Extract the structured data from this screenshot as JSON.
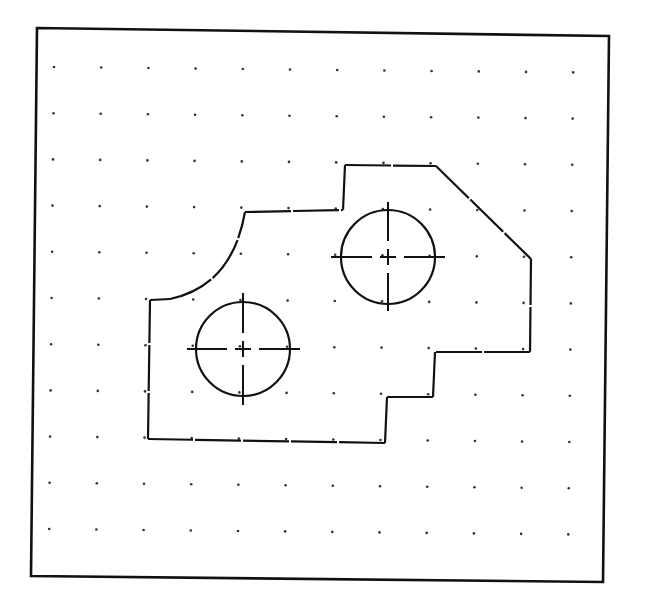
{
  "drawing": {
    "type": "cad-part-outline",
    "colors": {
      "background": "#ffffff",
      "ink": "#111111",
      "grid_dot": "#333333"
    },
    "frame": {
      "corners": [
        [
          37,
          28
        ],
        [
          609,
          36
        ],
        [
          603,
          582
        ],
        [
          31,
          576
        ]
      ]
    },
    "grid": {
      "origin": [
        54,
        67
      ],
      "spacing": [
        47.2,
        46.2
      ],
      "columns": 12,
      "rows": 11,
      "rotation_deg": 0.6
    },
    "outline": {
      "segments": [
        {
          "name": "left-edge",
          "d": "M148 439 L150 300"
        },
        {
          "name": "small-top-left",
          "d": "M150 300 L170 299"
        },
        {
          "name": "fillet-arc",
          "d": "M170 299 Q232 286 245 212"
        },
        {
          "name": "upper-left-top",
          "d": "M245 212 L343 210"
        },
        {
          "name": "step-up",
          "d": "M343 210 L345 165"
        },
        {
          "name": "top-edge",
          "d": "M345 165 L436 166"
        },
        {
          "name": "chamfer",
          "d": "M436 166 L531 259"
        },
        {
          "name": "right-edge",
          "d": "M531 259 L530 352"
        },
        {
          "name": "right-bottom",
          "d": "M530 352 L435 352"
        },
        {
          "name": "step-down-1",
          "d": "M435 352 L433 397"
        },
        {
          "name": "step-horizontal",
          "d": "M433 397 L387 397"
        },
        {
          "name": "step-down-2",
          "d": "M387 397 L385 443"
        },
        {
          "name": "bottom-edge",
          "d": "M385 443 L148 439"
        }
      ]
    },
    "holes": [
      {
        "name": "hole-left",
        "cx": 243,
        "cy": 349,
        "r": 47,
        "centerline_h": [
          187,
          300
        ],
        "centerline_v": [
          293,
          405
        ]
      },
      {
        "name": "hole-right",
        "cx": 388,
        "cy": 257,
        "r": 47,
        "centerline_h": [
          331,
          445
        ],
        "centerline_v": [
          202,
          311
        ]
      }
    ]
  }
}
